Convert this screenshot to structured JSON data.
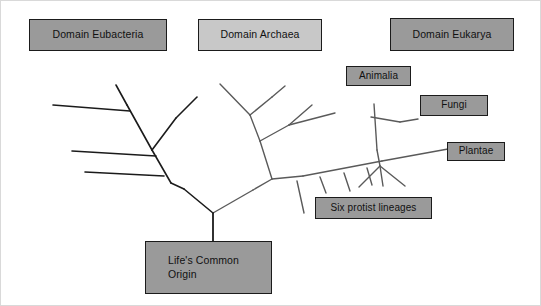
{
  "diagram": {
    "background_color": "#ffffff",
    "line_color_left": "#1b1b1b",
    "line_color_right": "#5a5a5a",
    "box_border_color": "#1b1b1b",
    "text_color": "#111111"
  },
  "labels": {
    "eubacteria": {
      "text": "Domain Eubacteria",
      "fill": "#9a9a9a",
      "x": 28,
      "y": 18,
      "w": 138,
      "h": 32
    },
    "archaea": {
      "text": "Domain Archaea",
      "fill": "#c8c8c8",
      "x": 197,
      "y": 18,
      "w": 124,
      "h": 32
    },
    "eukarya": {
      "text": "Domain Eukarya",
      "fill": "#9a9a9a",
      "x": 389,
      "y": 17,
      "w": 124,
      "h": 33
    },
    "animalia": {
      "text": "Animalia",
      "fill": "#9a9a9a",
      "x": 345,
      "y": 65,
      "w": 65,
      "h": 20
    },
    "fungi": {
      "text": "Fungi",
      "fill": "#9a9a9a",
      "x": 419,
      "y": 94,
      "w": 68,
      "h": 21
    },
    "plantae": {
      "text": "Plantae",
      "fill": "#9a9a9a",
      "x": 446,
      "y": 141,
      "w": 58,
      "h": 19
    },
    "protists": {
      "text": "Six protist lineages",
      "fill": "#9a9a9a",
      "x": 314,
      "y": 196,
      "w": 117,
      "h": 22
    },
    "origin": {
      "text": "Life's Common\nOrigin",
      "fill": "#9a9a9a",
      "x": 144,
      "y": 240,
      "w": 127,
      "h": 53
    }
  },
  "chart_data": {
    "type": "diagram",
    "subtype": "phylogenetic-tree",
    "root_label": "Life's Common Origin",
    "domains": [
      {
        "name": "Domain Eubacteria",
        "color": "#9a9a9a",
        "lineages": [
          "unnamed bacterial lineages"
        ],
        "branch_count": 5
      },
      {
        "name": "Domain Archaea",
        "color": "#c8c8c8",
        "lineages": [
          "unnamed archaeal lineages"
        ],
        "branch_count": 5
      },
      {
        "name": "Domain Eukarya",
        "color": "#9a9a9a",
        "lineages": [
          "Animalia",
          "Fungi",
          "Plantae",
          "Six protist lineages"
        ],
        "branch_count": 10
      }
    ],
    "tips_labeled": [
      "Animalia",
      "Fungi",
      "Plantae",
      "Six protist lineages"
    ],
    "protist_lineage_count": 6
  },
  "tree_paths": {
    "root_stem": "M 212,212 L 212,240",
    "left_lineage": [
      "M 212,212 L 183,188",
      "M 183,188 L 170,182",
      "M 170,182 L 151,149",
      "M 151,149 L 126,104",
      "M 126,104 L 115,84",
      "M 151,149 L 175,117",
      "M 175,117 L 196,96",
      "M 129,110 L 52,104",
      "M 155,155 L 71,150",
      "M 163,175 L 84,171"
    ],
    "right_lineage": [
      "M 212,212 L 252,189",
      "M 252,189 L 271,178",
      "M 271,178 L 259,140",
      "M 259,140 L 249,114",
      "M 249,114 L 219,83",
      "M 249,114 L 271,96",
      "M 271,96 L 284,85",
      "M 259,140 L 288,124",
      "M 288,124 L 311,104",
      "M 288,124 L 334,112",
      "M 271,178 L 302,175",
      "M 302,175 L 381,160",
      "M 381,160 L 447,148",
      "M 373,103 L 376,149",
      "M 376,149 L 379,165",
      "M 379,165 L 382,185",
      "M 370,116 L 399,121",
      "M 399,121 L 417,118",
      "M 296,180 L 303,212",
      "M 319,176 L 325,192",
      "M 343,172 L 349,190",
      "M 366,167 L 371,184",
      "M 379,165 L 358,186",
      "M 379,165 L 404,185"
    ]
  }
}
